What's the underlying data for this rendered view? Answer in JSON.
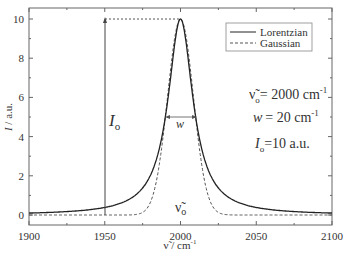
{
  "chart_data": {
    "type": "line",
    "title": "",
    "xlabel": "ν̃ / cm⁻¹",
    "ylabel": "I / a.u.",
    "xlim": [
      1900,
      2100
    ],
    "ylim": [
      -0.5,
      10.5
    ],
    "x_ticks": [
      1900,
      1950,
      2000,
      2050,
      2100
    ],
    "y_ticks": [
      0,
      2,
      4,
      6,
      8,
      10
    ],
    "grid": false,
    "legend_position": "upper right",
    "series": [
      {
        "name": "Lorentzian",
        "style": "solid",
        "center": 2000,
        "fwhm": 20,
        "amplitude": 10
      },
      {
        "name": "Gaussian",
        "style": "dashed",
        "center": 2000,
        "fwhm": 20,
        "amplitude": 10
      }
    ],
    "annotations": [
      {
        "text": "ν̃o = 2000 cm⁻¹"
      },
      {
        "text": "w = 20 cm⁻¹"
      },
      {
        "text": "Io =10 a.u."
      },
      {
        "text": "Io",
        "desc": "vertical arrow at x=1950 from 0 to 10"
      },
      {
        "text": "w",
        "desc": "double arrow across FWHM at I=5"
      },
      {
        "text": "ν̃o",
        "desc": "label under peak center"
      }
    ]
  },
  "labels": {
    "x_tick_labels": [
      "1900",
      "1950",
      "2000",
      "2050",
      "2100"
    ],
    "y_tick_labels": [
      "0",
      "2",
      "4",
      "6",
      "8",
      "10"
    ],
    "xlabel_main": "ν̃ / cm",
    "xlabel_sup": "-1",
    "ylabel_main": "I / a.u.",
    "legend": [
      "Lorentzian",
      "Gaussian"
    ],
    "param_nu": "ν̃",
    "param_nu_sub": "o",
    "param_nu_val": "= 2000 cm",
    "param_nu_sup": "-1",
    "param_w": "w",
    "param_w_val": "= 20 cm",
    "param_w_sup": "-1",
    "param_I": "I",
    "param_I_sub": "o",
    "param_I_val": "=10 a.u.",
    "arrow_I": "I",
    "arrow_I_sub": "o",
    "arrow_w": "w",
    "center_nu": "ν̃",
    "center_nu_sub": "o"
  }
}
